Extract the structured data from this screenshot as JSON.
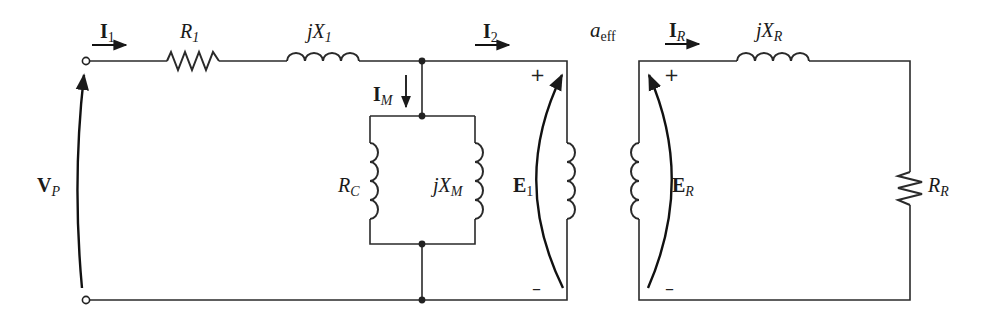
{
  "diagram": {
    "colors": {
      "line": "#2a2a2a",
      "background": "#ffffff"
    },
    "labels": {
      "i1": {
        "main": "I",
        "sub": "1"
      },
      "r1": {
        "main": "R",
        "sub": "1"
      },
      "jx1": {
        "main": "jX",
        "sub": "1"
      },
      "i2": {
        "main": "I",
        "sub": "2"
      },
      "aeff": {
        "main": "a",
        "sub": "eff"
      },
      "ir": {
        "main": "I",
        "sub": "R"
      },
      "jxr": {
        "main": "jX",
        "sub": "R"
      },
      "im": {
        "main": "I",
        "sub": "M"
      },
      "rc": {
        "main": "R",
        "sub": "C"
      },
      "jxm": {
        "main": "jX",
        "sub": "M"
      },
      "e1": {
        "main": "E",
        "sub": "1"
      },
      "er": {
        "main": "E",
        "sub": "R"
      },
      "rr": {
        "main": "R",
        "sub": "R"
      },
      "vp": {
        "main": "V",
        "sub": "P"
      }
    },
    "polarity": {
      "plus": "+",
      "minus": "–"
    },
    "components": [
      {
        "id": "R1",
        "type": "resistor",
        "branch": "series-primary"
      },
      {
        "id": "jX1",
        "type": "inductor",
        "branch": "series-primary"
      },
      {
        "id": "RC",
        "type": "inductor-shaped core-loss element",
        "branch": "shunt"
      },
      {
        "id": "jXM",
        "type": "inductor",
        "branch": "shunt"
      },
      {
        "id": "transformer",
        "type": "ideal transformer",
        "ratio": "a_eff"
      },
      {
        "id": "jXR",
        "type": "inductor",
        "branch": "series-rotor"
      },
      {
        "id": "RR",
        "type": "resistor",
        "branch": "rotor"
      }
    ]
  }
}
